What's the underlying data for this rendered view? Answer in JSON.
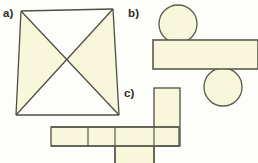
{
  "figure": {
    "background_color": "#fdfdfa",
    "fill_color": "#f8f7dc",
    "stroke_color": "#5a5a4e",
    "label_color": "#2b2b26",
    "width": 258,
    "height": 163
  },
  "parts": {
    "a": {
      "label": "a)",
      "shape_name": "four-pointed-star",
      "description": "Four-pointed star formed by two overlapping bowtie quadrilaterals",
      "star_points": "21,11 113,9 119,115 16,115",
      "bowtie_1": "21,11 119,115 113,9 16,115",
      "bowtie_2": "113,9 16,115 21,11 119,115",
      "outline": "21,11 67,57 113,9 78,56 119,115 67,66 16,115 55,57"
    },
    "b": {
      "label": "b)",
      "shape_name": "circles-and-bar",
      "description": "Two circles resting above and below a horizontal rectangle",
      "circle_top": {
        "cx": 178,
        "cy": 24,
        "r": 19
      },
      "circle_bottom": {
        "cx": 223,
        "cy": 87,
        "r": 19
      },
      "rectangle": {
        "x": 153,
        "y": 40,
        "width": 105,
        "height": 29
      }
    },
    "c": {
      "label": "c)",
      "shape_name": "cross-net",
      "description": "Net of rectangles: a horizontal strip of cells crossed by a vertical strip",
      "horizontal_strip": {
        "x": 51,
        "y": 127,
        "width": 128,
        "height": 19
      },
      "horizontal_dividers": [
        88,
        115,
        154
      ],
      "vertical_strip": {
        "x": 154,
        "y": 88,
        "width": 26,
        "height": 58
      },
      "vertical_tail": {
        "x": 115,
        "y": 127,
        "width": 39,
        "height": 36
      }
    }
  }
}
